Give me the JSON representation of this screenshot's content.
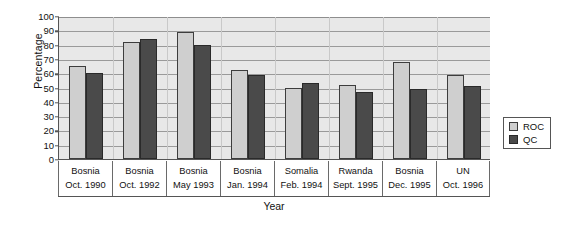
{
  "chart_data": {
    "type": "bar",
    "title": "",
    "xlabel": "Year",
    "ylabel": "Percentage",
    "ylim": [
      0,
      100
    ],
    "ytick_step": 10,
    "yticks": [
      100,
      90,
      80,
      70,
      60,
      50,
      40,
      30,
      20,
      10,
      0
    ],
    "grid": true,
    "legend_position": "right",
    "categories": [
      "Bosnia Oct. 1990",
      "Bosnia Oct. 1992",
      "Bosnia May 1993",
      "Bosnia Jan. 1994",
      "Somalia Feb. 1994",
      "Rwanda Sept. 1995",
      "Bosnia Dec. 1995",
      "UN Oct. 1996"
    ],
    "category_lines": [
      [
        "Bosnia",
        "Oct. 1990"
      ],
      [
        "Bosnia",
        "Oct. 1992"
      ],
      [
        "Bosnia",
        "May 1993"
      ],
      [
        "Bosnia",
        "Jan. 1994"
      ],
      [
        "Somalia",
        "Feb. 1994"
      ],
      [
        "Rwanda",
        "Sept. 1995"
      ],
      [
        "Bosnia",
        "Dec. 1995"
      ],
      [
        "UN",
        "Oct. 1996"
      ]
    ],
    "series": [
      {
        "name": "ROC",
        "color": "#cfcfcf",
        "values": [
          65,
          82,
          89,
          62,
          50,
          52,
          68,
          59
        ]
      },
      {
        "name": "QC",
        "color": "#4a4a4a",
        "values": [
          60,
          84,
          80,
          59,
          53,
          47,
          49,
          51
        ]
      }
    ]
  },
  "legend": {
    "items": [
      {
        "label": "ROC",
        "key": "roc"
      },
      {
        "label": "QC",
        "key": "qc"
      }
    ]
  }
}
